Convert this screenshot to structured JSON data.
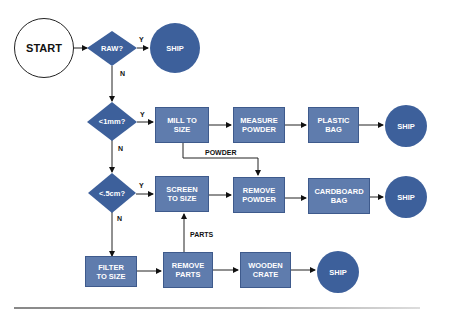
{
  "colors": {
    "box_fill": "#5f7cad",
    "box_border": "#3e5a8c",
    "decision_fill": "#3d609b",
    "terminal_fill": "#3d609b",
    "line": "#222222"
  },
  "nodes": {
    "start": {
      "label": "START",
      "shape": "circle"
    },
    "raw": {
      "label": "RAW?",
      "shape": "diamond"
    },
    "ship1": {
      "label": "SHIP",
      "shape": "circle"
    },
    "lt1mm": {
      "label": "<1mm?",
      "shape": "diamond"
    },
    "mill": {
      "label": "MILL TO\nSIZE",
      "shape": "box"
    },
    "measure": {
      "label": "MEASURE\nPOWDER",
      "shape": "box"
    },
    "plastic": {
      "label": "PLASTIC\nBAG",
      "shape": "box"
    },
    "ship2": {
      "label": "SHIP",
      "shape": "circle"
    },
    "lt5cm": {
      "label": "<.5cm?",
      "shape": "diamond"
    },
    "screen": {
      "label": "SCREEN\nTO SIZE",
      "shape": "box"
    },
    "removepowder": {
      "label": "REMOVE\nPOWDER",
      "shape": "box"
    },
    "cardboard": {
      "label": "CARDBOARD\nBAG",
      "shape": "box"
    },
    "ship3": {
      "label": "SHIP",
      "shape": "circle"
    },
    "filter": {
      "label": "FILTER\nTO SIZE",
      "shape": "box"
    },
    "removeparts": {
      "label": "REMOVE\nPARTS",
      "shape": "box"
    },
    "wooden": {
      "label": "WOODEN\nCRATE",
      "shape": "box"
    },
    "ship4": {
      "label": "SHIP",
      "shape": "circle"
    }
  },
  "edge_labels": {
    "raw_yes": "Y",
    "raw_no": "N",
    "mm_yes": "Y",
    "mm_no": "N",
    "cm_yes": "Y",
    "cm_no": "N",
    "powder": "POWDER",
    "parts": "PARTS"
  },
  "edges": [
    {
      "from": "start",
      "to": "raw"
    },
    {
      "from": "raw",
      "to": "ship1",
      "label": "Y"
    },
    {
      "from": "raw",
      "to": "lt1mm",
      "label": "N"
    },
    {
      "from": "lt1mm",
      "to": "mill",
      "label": "Y"
    },
    {
      "from": "mill",
      "to": "measure"
    },
    {
      "from": "measure",
      "to": "plastic"
    },
    {
      "from": "plastic",
      "to": "ship2"
    },
    {
      "from": "mill",
      "to": "removepowder",
      "label": "POWDER"
    },
    {
      "from": "lt1mm",
      "to": "lt5cm",
      "label": "N"
    },
    {
      "from": "lt5cm",
      "to": "screen",
      "label": "Y"
    },
    {
      "from": "screen",
      "to": "removepowder"
    },
    {
      "from": "removepowder",
      "to": "cardboard"
    },
    {
      "from": "cardboard",
      "to": "ship3"
    },
    {
      "from": "lt5cm",
      "to": "filter",
      "label": "N"
    },
    {
      "from": "filter",
      "to": "removeparts"
    },
    {
      "from": "removeparts",
      "to": "screen",
      "label": "PARTS"
    },
    {
      "from": "removeparts",
      "to": "wooden"
    },
    {
      "from": "wooden",
      "to": "ship4"
    }
  ]
}
